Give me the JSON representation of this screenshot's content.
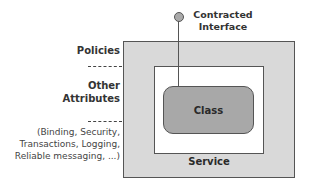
{
  "diagram": {
    "interface_label_line1": "Contracted",
    "interface_label_line2": "Interface",
    "class_label": "Class",
    "service_label": "Service",
    "left_labels": {
      "policies": "Policies",
      "other_line1": "Other",
      "other_line2": "Attributes",
      "examples_line1": "(Binding, Security,",
      "examples_line2": "Transactions, Logging,",
      "examples_line3": "Reliable messaging, ...)"
    },
    "colors": {
      "outer_fill": "#d9d9d9",
      "inner_fill": "#ffffff",
      "class_fill": "#a8a8a8",
      "stroke": "#555555"
    }
  }
}
